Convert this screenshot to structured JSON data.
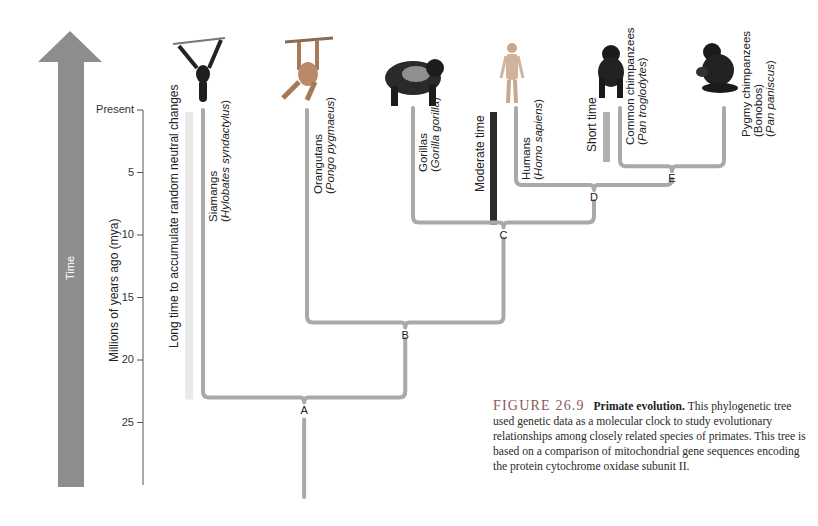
{
  "time_arrow": {
    "label": "Time",
    "color": "#8d8d8d"
  },
  "axis": {
    "title": "Millions of years ago (mya)",
    "ticks": [
      {
        "value": 0,
        "label": "Present"
      },
      {
        "value": 5,
        "label": "5"
      },
      {
        "value": 10,
        "label": "10"
      },
      {
        "value": 15,
        "label": "15"
      },
      {
        "value": 20,
        "label": "20"
      },
      {
        "value": 25,
        "label": "25"
      }
    ],
    "range_mya": [
      0,
      30
    ]
  },
  "time_bars": {
    "long": {
      "label": "Long time to accumulate random neutral changes",
      "color": "#eaeaea",
      "span_mya": [
        0,
        23
      ]
    },
    "moderate": {
      "label": "Moderate time",
      "color": "#2b2b2b",
      "span_mya": [
        0,
        9
      ]
    },
    "short": {
      "label": "Short time",
      "color": "#b0b0b0",
      "span_mya": [
        0,
        4
      ]
    }
  },
  "species": [
    {
      "id": "siamang",
      "common": "Siamangs",
      "scientific": "Hylobates syndactylus",
      "icon": "siamang-icon"
    },
    {
      "id": "orangutan",
      "common": "Orangutans",
      "scientific": "Pongo pygmaeus",
      "icon": "orangutan-icon"
    },
    {
      "id": "gorilla",
      "common": "Gorillas",
      "scientific": "Gorilla gorilla",
      "icon": "gorilla-icon"
    },
    {
      "id": "human",
      "common": "Humans",
      "scientific": "Homo sapiens",
      "icon": "human-icon"
    },
    {
      "id": "common-chimp",
      "common": "Common chimpanzees",
      "scientific": "Pan troglodytes",
      "icon": "chimpanzee-icon"
    },
    {
      "id": "bonobo",
      "common": "Pygmy chimpanzees",
      "alt": "(Bonobos)",
      "scientific": "Pan paniscus",
      "icon": "bonobo-icon"
    }
  ],
  "nodes": [
    {
      "label": "A",
      "mya": 23,
      "children": [
        "siamang",
        "B"
      ]
    },
    {
      "label": "B",
      "mya": 17,
      "children": [
        "orangutan",
        "C"
      ]
    },
    {
      "label": "C",
      "mya": 9,
      "children": [
        "gorilla",
        "D"
      ]
    },
    {
      "label": "D",
      "mya": 6,
      "children": [
        "human",
        "E"
      ]
    },
    {
      "label": "E",
      "mya": 4.5,
      "children": [
        "common-chimp",
        "bonobo"
      ]
    }
  ],
  "branch_color": "#a9a9a9",
  "caption": {
    "figure_number": "FIGURE 26.9",
    "title": "Primate evolution.",
    "body": "This phylogenetic tree used genetic data as a molecular clock to study evolutionary relationships among closely related species of primates. This tree is based on a comparison of mitochondrial gene sequences encoding the protein cytochrome oxidase subunit II."
  }
}
